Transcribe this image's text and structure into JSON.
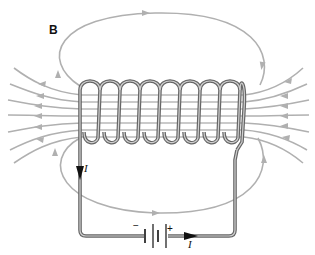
{
  "figure": {
    "labels": {
      "field": "B",
      "current_top": "I",
      "current_bottom": "I",
      "battery_negative": "−",
      "battery_positive": "+"
    },
    "components": {
      "solenoid_turns": 9,
      "battery": "DC source",
      "field_lines_left": 7,
      "field_lines_right": 7
    },
    "colors": {
      "field_line": "#aaaaaa",
      "wire": "#666666",
      "wire_highlight": "#cccccc",
      "arrow": "#111111",
      "label": "#111111"
    }
  }
}
